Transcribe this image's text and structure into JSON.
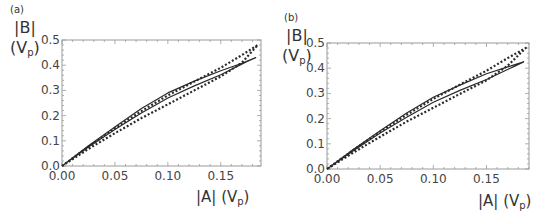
{
  "panels": [
    {
      "label": "(a)",
      "ylabel_main": "|B|",
      "ylabel_unit": "(V",
      "ylabel_sub": "p",
      "ylabel_close": ")",
      "xlabel_main": "|A| (V",
      "xlabel_sub": "p",
      "xlabel_close": ")"
    },
    {
      "label": "(b)",
      "ylabel_main": "|B|",
      "ylabel_unit": "(V",
      "ylabel_sub": "p",
      "ylabel_close": ")",
      "xlabel_main": "|A| (V",
      "xlabel_sub": "p",
      "xlabel_close": ")"
    }
  ],
  "chart_data": [
    {
      "type": "line",
      "title": "(a)",
      "xlabel": "|A| (Vp)",
      "ylabel": "|B| (Vp)",
      "xlim": [
        0,
        0.188
      ],
      "ylim": [
        0,
        0.5
      ],
      "xticks": [
        "0.00",
        "0.05",
        "0.10",
        "0.15"
      ],
      "yticks": [
        "0.0",
        "0.1",
        "0.2",
        "0.3",
        "0.4",
        "0.5"
      ],
      "grid": false,
      "frame": true,
      "series": [
        {
          "name": "solid loop",
          "style": "solid",
          "x": [
            0,
            0.025,
            0.05,
            0.075,
            0.1,
            0.125,
            0.15,
            0.17,
            0.183,
            0.175,
            0.15,
            0.125,
            0.1,
            0.075,
            0.05,
            0.025,
            0
          ],
          "y": [
            0,
            0.08,
            0.155,
            0.228,
            0.29,
            0.337,
            0.378,
            0.408,
            0.43,
            0.415,
            0.362,
            0.318,
            0.27,
            0.21,
            0.145,
            0.075,
            0
          ]
        },
        {
          "name": "dotted loop",
          "style": "dotted",
          "x": [
            0,
            0.025,
            0.05,
            0.075,
            0.1,
            0.125,
            0.15,
            0.17,
            0.185,
            0.17,
            0.15,
            0.125,
            0.1,
            0.075,
            0.05,
            0.025,
            0
          ],
          "y": [
            0,
            0.077,
            0.15,
            0.218,
            0.28,
            0.335,
            0.39,
            0.44,
            0.48,
            0.41,
            0.355,
            0.3,
            0.245,
            0.19,
            0.13,
            0.068,
            0
          ]
        }
      ]
    },
    {
      "type": "line",
      "title": "(b)",
      "xlabel": "|A| (Vp)",
      "ylabel": "|B| (Vp)",
      "xlim": [
        0,
        0.19
      ],
      "ylim": [
        0,
        0.5
      ],
      "xticks": [
        "0.00",
        "0.05",
        "0.10",
        "0.15"
      ],
      "yticks": [
        "0.0",
        "0.1",
        "0.2",
        "0.3",
        "0.4",
        "0.5"
      ],
      "grid": false,
      "frame": true,
      "series": [
        {
          "name": "solid loop",
          "style": "solid",
          "x": [
            0,
            0.025,
            0.05,
            0.075,
            0.1,
            0.125,
            0.15,
            0.17,
            0.185,
            0.175,
            0.15,
            0.125,
            0.1,
            0.075,
            0.05,
            0.025,
            0
          ],
          "y": [
            0,
            0.078,
            0.152,
            0.222,
            0.285,
            0.333,
            0.378,
            0.405,
            0.425,
            0.405,
            0.355,
            0.312,
            0.265,
            0.205,
            0.143,
            0.073,
            0
          ]
        },
        {
          "name": "dotted loop",
          "style": "dotted",
          "x": [
            0,
            0.025,
            0.05,
            0.075,
            0.1,
            0.125,
            0.15,
            0.17,
            0.187,
            0.17,
            0.15,
            0.125,
            0.1,
            0.075,
            0.05,
            0.025,
            0
          ],
          "y": [
            0,
            0.076,
            0.148,
            0.215,
            0.278,
            0.335,
            0.39,
            0.44,
            0.48,
            0.41,
            0.352,
            0.298,
            0.243,
            0.188,
            0.128,
            0.066,
            0
          ]
        }
      ]
    }
  ]
}
